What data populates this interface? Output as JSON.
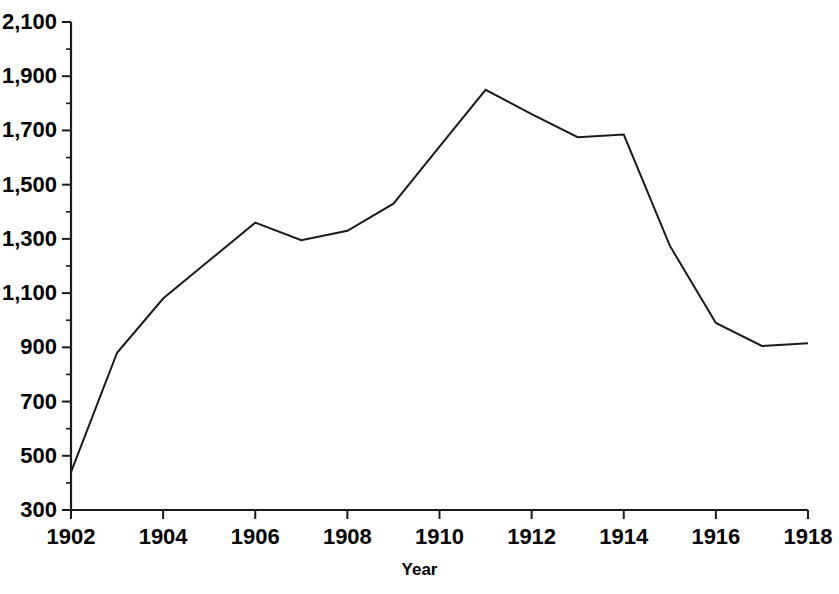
{
  "chart_data": {
    "type": "line",
    "title": "",
    "subtitle": "",
    "xlabel": "Year",
    "ylabel": "",
    "grid": false,
    "legend": false,
    "x": [
      1902,
      1903,
      1904,
      1905,
      1906,
      1907,
      1908,
      1909,
      1910,
      1911,
      1912,
      1913,
      1914,
      1915,
      1916,
      1917,
      1918
    ],
    "values": [
      440,
      880,
      1080,
      1220,
      1360,
      1295,
      1330,
      1430,
      1640,
      1850,
      1760,
      1675,
      1685,
      1275,
      990,
      905,
      915
    ],
    "series": [
      {
        "name": "",
        "color": "#1a1a1a",
        "values": [
          440,
          880,
          1080,
          1220,
          1360,
          1295,
          1330,
          1430,
          1640,
          1850,
          1760,
          1675,
          1685,
          1275,
          990,
          905,
          915
        ]
      }
    ],
    "xlim": [
      1902,
      1918
    ],
    "ylim": [
      300,
      2100
    ],
    "xticks": [
      1902,
      1904,
      1906,
      1908,
      1910,
      1912,
      1914,
      1916,
      1918
    ],
    "xtick_labels": [
      "1902",
      "1904",
      "1906",
      "1908",
      "1910",
      "1912",
      "1914",
      "1916",
      "1918"
    ],
    "yticks": [
      300,
      500,
      700,
      900,
      1100,
      1300,
      1500,
      1700,
      1900,
      2100
    ],
    "ytick_labels": [
      "300",
      "500",
      "700",
      "900",
      "1,100",
      "1,300",
      "1,500",
      "1,700",
      "1,900",
      "2,100"
    ],
    "xtick_minor": [
      1903,
      1905,
      1907,
      1909,
      1911,
      1913,
      1915,
      1917
    ],
    "ytick_minor": [
      400,
      600,
      800,
      1000,
      1200,
      1400,
      1600,
      1800,
      2000
    ],
    "line_color": "#1a1a1a",
    "line_width": 2,
    "axis_color": "#1a1a1a",
    "background": "#ffffff"
  }
}
